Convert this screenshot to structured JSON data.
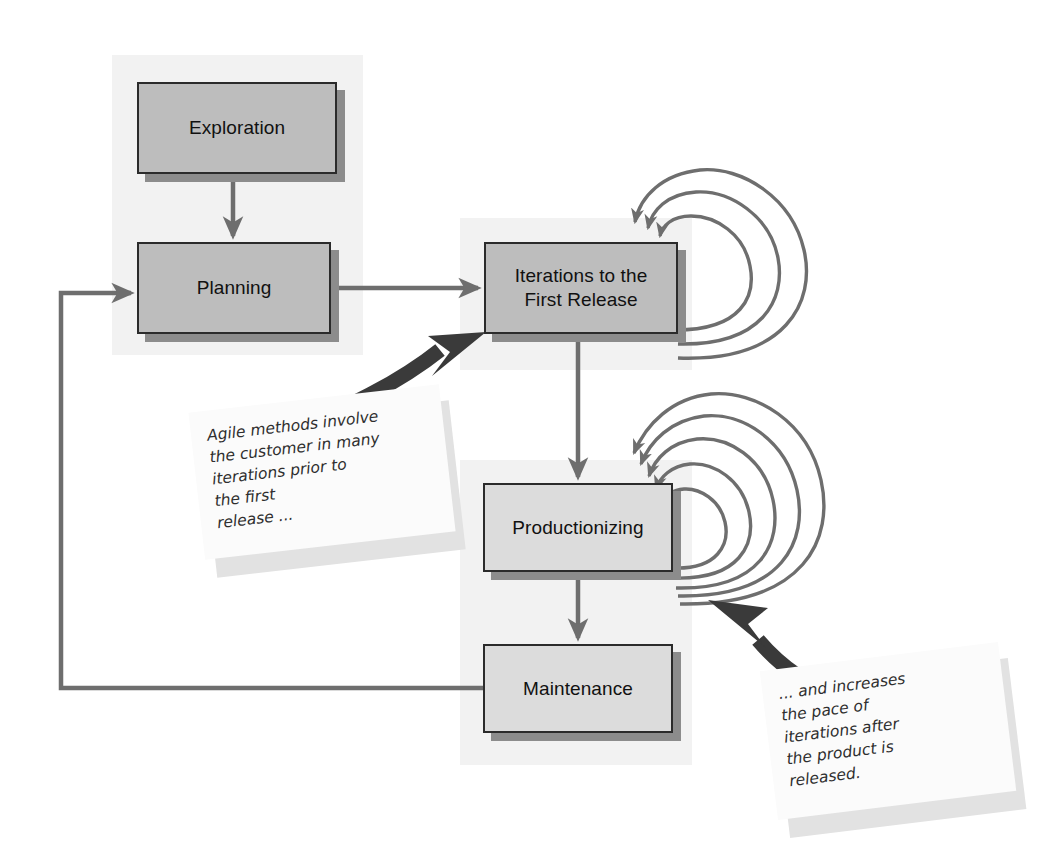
{
  "diagram": {
    "colors": {
      "panel_bg": "#f2f2f2",
      "box_dark": "#bdbdbd",
      "box_light": "#dcdcdc",
      "box_border": "#2b2b2b",
      "box_shadow": "#8c8c8c",
      "connector": "#6e6e6e",
      "loop_stroke": "#6e6e6e",
      "bold_arrow": "#3a3a3a",
      "note_bg": "#fbfbfb",
      "note_shadow": "#e2e2e2",
      "page_bg": "#ffffff"
    },
    "boxes": [
      {
        "id": "exploration",
        "label": "Exploration"
      },
      {
        "id": "planning",
        "label": "Planning"
      },
      {
        "id": "iterations",
        "label": "Iterations to the\nFirst Release"
      },
      {
        "id": "productionizing",
        "label": "Productionizing"
      },
      {
        "id": "maintenance",
        "label": "Maintenance"
      }
    ],
    "box_labels": {
      "exploration": "Exploration",
      "planning": "Planning",
      "iterations_line1": "Iterations to the",
      "iterations_line2": "First Release",
      "productionizing": "Productionizing",
      "maintenance": "Maintenance"
    },
    "notes": [
      {
        "id": "note-agile-methods",
        "lines": [
          "Agile methods involve",
          "the customer in many",
          "iterations prior to",
          "the first",
          "release ..."
        ]
      },
      {
        "id": "note-increases-pace",
        "lines": [
          "... and increases",
          "the pace of",
          "iterations after",
          "the product is",
          "released."
        ]
      }
    ],
    "connections": [
      {
        "from": "exploration",
        "to": "planning",
        "style": "thin-arrow",
        "direction": "down"
      },
      {
        "from": "planning",
        "to": "iterations",
        "style": "thin-arrow",
        "direction": "right"
      },
      {
        "from": "iterations",
        "to": "productionizing",
        "style": "thin-arrow",
        "direction": "down"
      },
      {
        "from": "productionizing",
        "to": "maintenance",
        "style": "thin-arrow",
        "direction": "down"
      },
      {
        "from": "maintenance",
        "to": "planning",
        "style": "thin-arrow",
        "direction": "feedback-loop-left"
      },
      {
        "from": "note-agile-methods",
        "to": "iterations",
        "style": "bold-curved-arrow"
      },
      {
        "from": "note-increases-pace",
        "to": "productionizing",
        "style": "bold-curved-arrow"
      }
    ],
    "iteration_loops": {
      "iterations": {
        "count": 3,
        "label": "iteration loops into Iterations to the First Release"
      },
      "productionizing": {
        "count": 5,
        "label": "iteration loops into Productionizing"
      }
    }
  }
}
